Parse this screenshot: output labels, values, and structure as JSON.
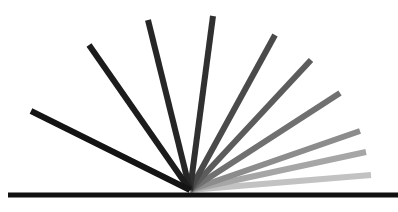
{
  "diagram": {
    "origin": [
      190,
      190
    ],
    "baseline": {
      "x1": 8,
      "x2": 398,
      "y": 195,
      "width": 5,
      "color": "#111111"
    },
    "ray_width": 6,
    "rays": [
      {
        "end": [
          31,
          111
        ],
        "color": "#141414"
      },
      {
        "end": [
          89,
          45
        ],
        "color": "#1c1c1c"
      },
      {
        "end": [
          148,
          20
        ],
        "color": "#262626"
      },
      {
        "end": [
          213,
          16
        ],
        "color": "#303030"
      },
      {
        "end": [
          275,
          35
        ],
        "color": "#4a4a4a"
      },
      {
        "end": [
          311,
          60
        ],
        "color": "#5c5c5c"
      },
      {
        "end": [
          340,
          93
        ],
        "color": "#707070"
      },
      {
        "end": [
          360,
          131
        ],
        "color": "#8c8c8c"
      },
      {
        "end": [
          366,
          152
        ],
        "color": "#a6a6a6"
      },
      {
        "end": [
          371,
          175
        ],
        "color": "#c2c2c2"
      }
    ]
  }
}
